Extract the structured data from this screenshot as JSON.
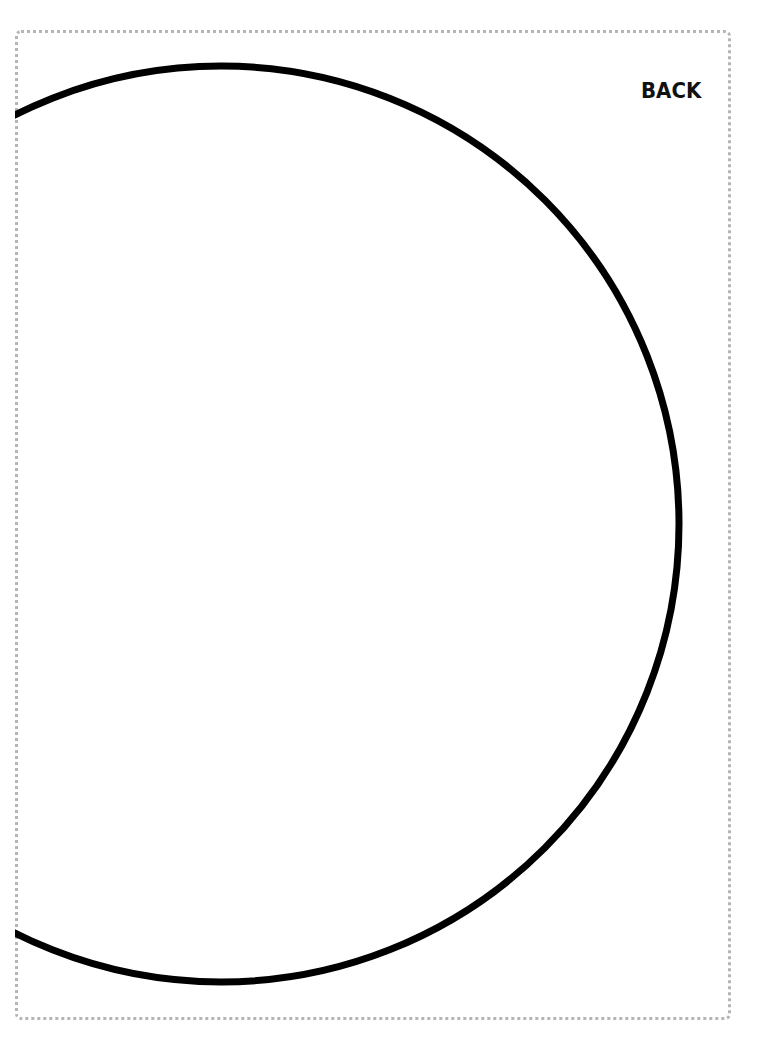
{
  "page": {
    "label": "BACK",
    "border_style": "dotted",
    "border_color": "#b5b5b5",
    "background_color": "#ffffff"
  },
  "shape": {
    "type": "circle",
    "stroke_color": "#000000",
    "stroke_width": 7,
    "center_x": 221,
    "center_y": 524,
    "radius": 458
  }
}
